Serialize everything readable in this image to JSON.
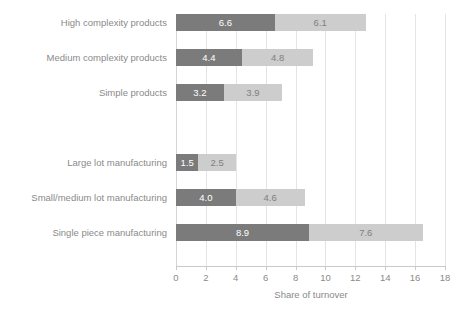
{
  "chart_data": {
    "type": "bar",
    "orientation": "horizontal",
    "stacked": true,
    "title": "",
    "xlabel": "Share of turnover",
    "ylabel": "",
    "xlim": [
      0,
      18
    ],
    "xticks": [
      0,
      2,
      4,
      6,
      8,
      10,
      12,
      14,
      16,
      18
    ],
    "grid": true,
    "legend": "none",
    "categories": [
      "High complexity products",
      "Medium complexity products",
      "Simple products",
      "",
      "Large lot manufacturing",
      "Small/medium lot manufacturing",
      "Single piece manufacturing"
    ],
    "series": [
      {
        "name": "primary",
        "color": "#7b7b7b",
        "values": [
          6.6,
          4.4,
          3.2,
          null,
          1.5,
          4.0,
          8.9
        ],
        "labels": [
          "6.6",
          "4.4",
          "3.2",
          "",
          "1.5",
          "4.0",
          "8.9"
        ]
      },
      {
        "name": "secondary",
        "color": "#cdcdcd",
        "values": [
          6.1,
          4.8,
          3.9,
          null,
          2.5,
          4.6,
          7.6
        ],
        "labels": [
          "6.1",
          "4.8",
          "3.9",
          "",
          "2.5",
          "4.6",
          "7.6"
        ]
      }
    ],
    "totals": [
      12.7,
      9.2,
      7.1,
      null,
      4.0,
      8.6,
      16.5
    ],
    "colors": {
      "primary_segment": "#7b7b7b",
      "secondary_segment": "#cdcdcd",
      "gridline": "#e4e4e4",
      "axis_line": "#c9c9c9",
      "text": "#8a8a8a",
      "primary_label_text": "#ffffff",
      "secondary_label_text": "#7f7f7f",
      "background": "#ffffff"
    }
  }
}
